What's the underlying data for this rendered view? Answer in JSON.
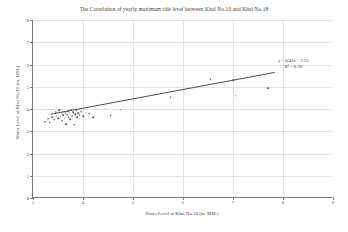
{
  "chart_data": {
    "type": "scatter",
    "title": "The Correlation  of yearly maximum tide level  between Khal No.10 and Khal No.18",
    "xlabel": "Water Level at Khal No.18   (m.  MSL)",
    "ylabel": "Water Level at Khal No.10   (m. MSL)",
    "xlim": [
      3,
      9
    ],
    "ylim": [
      0,
      8
    ],
    "xticks": [
      3,
      4,
      5,
      6,
      7,
      8,
      9
    ],
    "yticks": [
      0,
      1,
      2,
      3,
      4,
      5,
      6,
      7,
      8
    ],
    "grid": true,
    "legend": "none",
    "marker_color": "#585858",
    "trendline_color": "#3a3a3a",
    "annotation": {
      "equation": "y = 0.42x + 2.33",
      "r2": "R² = 0.78",
      "slope": 0.42,
      "intercept": 2.33,
      "r_squared": 0.78
    },
    "trendline": {
      "x_start": 3.35,
      "x_end": 7.85,
      "y_start": 3.74,
      "y_end": 5.63
    },
    "points": [
      [
        3.24,
        3.42
      ],
      [
        3.3,
        3.56
      ],
      [
        3.33,
        3.4
      ],
      [
        3.38,
        3.64
      ],
      [
        3.42,
        3.52
      ],
      [
        3.45,
        3.86
      ],
      [
        3.47,
        3.7
      ],
      [
        3.5,
        3.58
      ],
      [
        3.52,
        3.95
      ],
      [
        3.55,
        3.66
      ],
      [
        3.57,
        3.78
      ],
      [
        3.58,
        3.47
      ],
      [
        3.6,
        3.72
      ],
      [
        3.62,
        3.88
      ],
      [
        3.63,
        3.6
      ],
      [
        3.65,
        3.8
      ],
      [
        3.66,
        3.33
      ],
      [
        3.68,
        3.74
      ],
      [
        3.7,
        3.9
      ],
      [
        3.71,
        3.62
      ],
      [
        3.73,
        3.83
      ],
      [
        3.74,
        3.55
      ],
      [
        3.76,
        3.96
      ],
      [
        3.78,
        3.7
      ],
      [
        3.8,
        3.86
      ],
      [
        3.82,
        3.3
      ],
      [
        3.84,
        3.76
      ],
      [
        3.86,
        3.92
      ],
      [
        3.88,
        3.64
      ],
      [
        3.9,
        3.81
      ],
      [
        3.93,
        3.72
      ],
      [
        3.96,
        3.88
      ],
      [
        4.0,
        3.68
      ],
      [
        4.05,
        3.84
      ],
      [
        4.12,
        3.78
      ],
      [
        4.2,
        3.62
      ],
      [
        4.45,
        4.02
      ],
      [
        4.55,
        3.72
      ],
      [
        4.75,
        3.96
      ],
      [
        5.75,
        4.52
      ],
      [
        6.55,
        5.33
      ],
      [
        7.0,
        5.3
      ],
      [
        7.05,
        4.6
      ],
      [
        7.7,
        4.93
      ]
    ]
  }
}
